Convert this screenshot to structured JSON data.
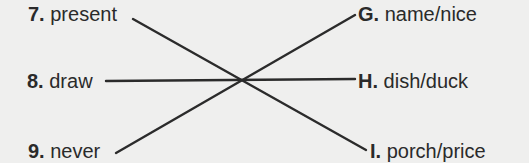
{
  "exercise": {
    "left_items": [
      {
        "number": "7.",
        "word": "present"
      },
      {
        "number": "8.",
        "word": "draw"
      },
      {
        "number": "9.",
        "word": "never"
      }
    ],
    "right_items": [
      {
        "letter": "G.",
        "words": "name/nice"
      },
      {
        "letter": "H.",
        "words": "dish/duck"
      },
      {
        "letter": "I.",
        "words": "porch/price"
      }
    ],
    "matches": [
      {
        "from": "7. present",
        "to": "I. porch/price"
      },
      {
        "from": "8. draw",
        "to": "H. dish/duck"
      },
      {
        "from": "9. never",
        "to": "G. name/nice"
      }
    ],
    "line_color": "#2b2b2b",
    "background_color": "#efefee"
  }
}
